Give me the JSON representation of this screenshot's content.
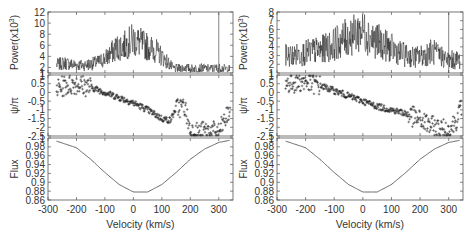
{
  "chart_data": [
    {
      "type": "line",
      "figure": "left",
      "xlabel": "Velocity (km/s)",
      "xlim": [
        -300,
        350
      ],
      "xticks": [
        -300,
        -200,
        -100,
        0,
        100,
        200,
        300
      ],
      "panels": [
        {
          "name": "power",
          "type": "line",
          "ylabel": "Power(x10^3)",
          "ylabel_display": "Power(x10",
          "ylabel_sup": "3",
          "ylim": [
            1,
            12
          ],
          "yticks": [
            1,
            2,
            4,
            6,
            8,
            10,
            12
          ],
          "series": [
            {
              "name": "power",
              "x": [
                -270,
                -240,
                -210,
                -180,
                -150,
                -120,
                -90,
                -60,
                -30,
                0,
                20,
                40,
                60,
                80,
                100,
                120,
                140,
                160,
                180,
                200,
                220,
                240,
                260,
                280,
                300,
                320,
                340
              ],
              "values": [
                2.5,
                2.8,
                2.5,
                2.4,
                2.6,
                3.0,
                4.0,
                5.5,
                6.0,
                7.0,
                6.5,
                6.0,
                5.5,
                5.0,
                4.0,
                3.0,
                1.8,
                1.8,
                2.0,
                1.8,
                1.8,
                1.9,
                1.8,
                1.8,
                1.9,
                1.8,
                1.7
              ]
            }
          ],
          "annotations": [
            "vertical spike near v=300"
          ]
        },
        {
          "name": "phase",
          "type": "scatter",
          "ylabel": "ψ/π",
          "ylim": [
            -2.5,
            1
          ],
          "yticks": [
            1,
            0.5,
            0,
            -0.5,
            -1,
            -1.5,
            -2,
            -2.5
          ],
          "series": [
            {
              "name": "phase",
              "x": [
                -270,
                -240,
                -200,
                -150,
                -100,
                -50,
                0,
                50,
                100,
                130,
                150,
                180,
                200,
                230,
                260,
                300,
                340
              ],
              "values": [
                0.2,
                0.4,
                0.5,
                0.3,
                0.0,
                -0.3,
                -0.6,
                -1.0,
                -1.5,
                -1.6,
                -0.9,
                -0.8,
                -2.2,
                -2.3,
                -2.2,
                -2.3,
                -1.0
              ]
            }
          ]
        },
        {
          "name": "flux",
          "type": "line",
          "ylabel": "Flux",
          "ylim": [
            0.86,
            1.0
          ],
          "yticks": [
            0.86,
            0.88,
            0.9,
            0.92,
            0.94,
            0.96,
            0.98,
            1
          ],
          "series": [
            {
              "name": "flux",
              "x": [
                -270,
                -200,
                -150,
                -100,
                -50,
                0,
                50,
                100,
                150,
                200,
                250,
                300,
                340
              ],
              "values": [
                0.993,
                0.978,
                0.952,
                0.922,
                0.895,
                0.878,
                0.878,
                0.895,
                0.922,
                0.952,
                0.975,
                0.99,
                0.995
              ]
            }
          ]
        }
      ]
    },
    {
      "type": "line",
      "figure": "right",
      "xlabel": "Velocity (km/s)",
      "xlim": [
        -300,
        350
      ],
      "xticks": [
        -300,
        -200,
        -100,
        0,
        100,
        200,
        300
      ],
      "panels": [
        {
          "name": "power",
          "type": "line",
          "ylabel": "Power(x10^3)",
          "ylabel_display": "Power(x10",
          "ylabel_sup": "3",
          "ylim": [
            1,
            8
          ],
          "yticks": [
            1,
            2,
            3,
            4,
            5,
            6,
            7,
            8
          ],
          "series": [
            {
              "name": "power",
              "x": [
                -270,
                -240,
                -210,
                -180,
                -150,
                -120,
                -90,
                -60,
                -30,
                0,
                30,
                60,
                90,
                120,
                150,
                180,
                210,
                240,
                270,
                300,
                330,
                340
              ],
              "values": [
                3.0,
                3.0,
                3.2,
                3.5,
                3.6,
                4.0,
                4.5,
                5.0,
                5.5,
                6.0,
                5.0,
                4.5,
                4.0,
                3.5,
                3.0,
                2.8,
                3.0,
                3.5,
                3.0,
                2.5,
                2.5,
                2.5
              ]
            }
          ],
          "annotations": [
            "vertical spike near v=300"
          ]
        },
        {
          "name": "phase",
          "type": "scatter",
          "ylabel": "ψ/π",
          "ylim": [
            -2.5,
            1
          ],
          "yticks": [
            1,
            0.5,
            0,
            -0.5,
            -1,
            -1.5,
            -2,
            -2.5
          ],
          "series": [
            {
              "name": "phase",
              "x": [
                -270,
                -230,
                -200,
                -150,
                -100,
                -50,
                0,
                50,
                100,
                150,
                200,
                250,
                300,
                330,
                345
              ],
              "values": [
                0.5,
                0.6,
                0.6,
                0.4,
                0.1,
                -0.2,
                -0.5,
                -0.8,
                -1.0,
                -1.2,
                -1.6,
                -2.0,
                -2.2,
                -1.5,
                -0.8
              ]
            }
          ]
        },
        {
          "name": "flux",
          "type": "line",
          "ylabel": "Flux",
          "ylim": [
            0.86,
            1.0
          ],
          "yticks": [
            0.86,
            0.88,
            0.9,
            0.92,
            0.94,
            0.96,
            0.98,
            1
          ],
          "series": [
            {
              "name": "flux",
              "x": [
                -270,
                -200,
                -150,
                -100,
                -50,
                0,
                50,
                100,
                150,
                200,
                250,
                300,
                340
              ],
              "values": [
                0.993,
                0.978,
                0.952,
                0.922,
                0.895,
                0.878,
                0.878,
                0.895,
                0.922,
                0.952,
                0.975,
                0.99,
                0.995
              ]
            }
          ]
        }
      ]
    }
  ],
  "figures": [
    {
      "id": "left",
      "xlabel": "Velocity (km/s)"
    },
    {
      "id": "right",
      "xlabel": "Velocity (km/s)"
    }
  ]
}
